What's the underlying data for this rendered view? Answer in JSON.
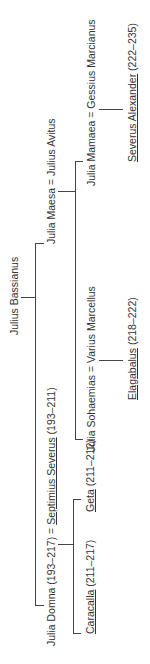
{
  "tree": {
    "root": {
      "name": "Julius Bassianus"
    },
    "maesa_couple": {
      "wife": "Julia Maesa",
      "sep": " = ",
      "husband": "Julius Avitus"
    },
    "domna_couple": {
      "wife": "Julia Domna",
      "wife_reign": " (193–217)",
      "sep": " = ",
      "husband": "Septimius Severus",
      "husband_reign": " (193–211)"
    },
    "mamaea_couple": {
      "wife": "Julia Mamaea",
      "sep": " = ",
      "husband": "Gessius Marcianus"
    },
    "soaemias_couple": {
      "wife": "Julia Sohaemias",
      "sep": " = ",
      "husband": "Varius Marcellus"
    },
    "children": {
      "alexander": {
        "prefix": "Severus ",
        "name": "Alexander",
        "reign": " (222–235)"
      },
      "elagabalus": {
        "name": "Elagabalus",
        "reign": " (218–222)"
      },
      "caracalla": {
        "name": "Caracalla",
        "reign": " (211–217)"
      },
      "geta": {
        "name": "Geta",
        "reign": " (211–212)"
      }
    }
  }
}
